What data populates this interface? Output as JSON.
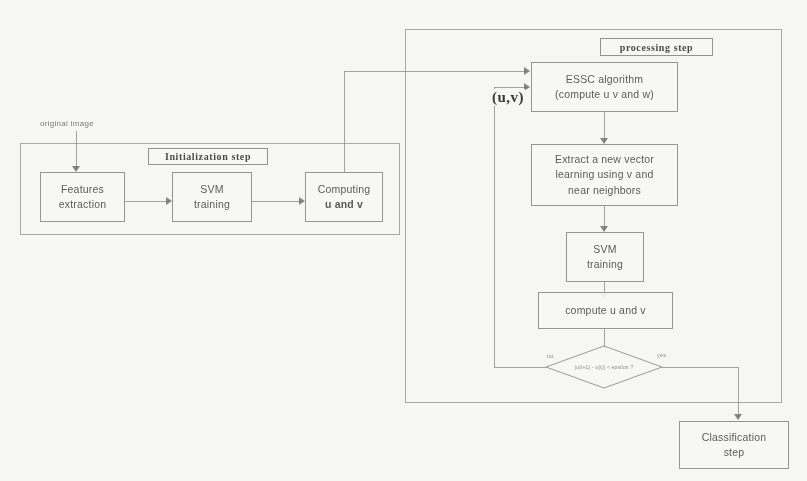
{
  "diagram": {
    "title_hidden": "ESSC semi-supervised SVM flowchart",
    "input_label": "original image",
    "groups": [
      {
        "id": "initialization",
        "label": "Initialization step"
      },
      {
        "id": "processing",
        "label": "processing step"
      }
    ],
    "nodes": [
      {
        "id": "features-extraction",
        "line1": "Features",
        "line2": "extraction"
      },
      {
        "id": "svm-training-init",
        "line1": "SVM",
        "line2": "training"
      },
      {
        "id": "computing-uv",
        "line1": "Computing",
        "line2": "u and v"
      },
      {
        "id": "essc-algorithm",
        "line1": "ESSC algorithm",
        "line2": "(compute u v and w)"
      },
      {
        "id": "extract-vector",
        "line1": "Extract a new vector",
        "line2": "learning using v and",
        "line3": "near neighbors"
      },
      {
        "id": "svm-training-proc",
        "line1": "SVM",
        "line2": "training"
      },
      {
        "id": "compute-uv",
        "line1": "compute u and v"
      },
      {
        "id": "classification-step",
        "line1": "Classification",
        "line2": "step"
      }
    ],
    "decision": {
      "id": "convergence-test",
      "text": "|u(t+1) - u(t)| < epsilon ?",
      "label_no": "no",
      "label_yes": "yes"
    },
    "feedback_label": "(u,v)",
    "colors": {
      "background": "#fbfbf9",
      "line": "#8d8d8d",
      "text": "#4a4a4a",
      "box_fill": "#fdfdfc"
    }
  }
}
